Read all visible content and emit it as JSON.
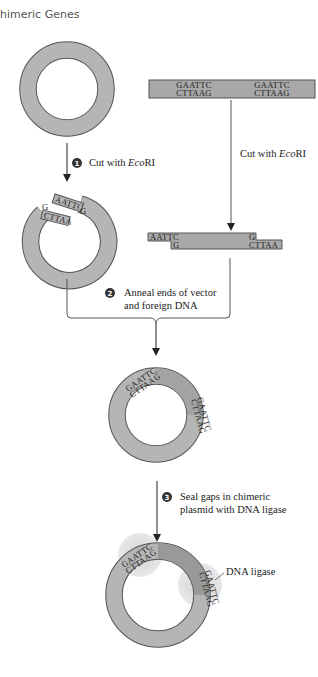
{
  "header": {
    "title": "himeric Genes"
  },
  "colors": {
    "dna_fill": "#b5b5b5",
    "dna_fill_dark": "#999999",
    "outline": "#555555",
    "ligase_spot": "#d6d6d6",
    "text": "#222222",
    "arrow": "#333333"
  },
  "foreign_dna": {
    "top_left": "GAATTC",
    "bottom_left": "CTTAAG",
    "top_right": "GAATTC",
    "bottom_right": "CTTAAG"
  },
  "cut_fragment": {
    "top_left": "AATTC",
    "bottom_left": "G",
    "top_right": "G",
    "bottom_right": "CTTAA"
  },
  "cut_plasmid": {
    "upper_end": "AATTC",
    "upper_end_g": "G",
    "lower_end": "CTTAA",
    "lower_end_g": "G"
  },
  "steps": [
    {
      "number": "1",
      "label_prefix": "Cut with ",
      "label_italic": "Eco",
      "label_suffix": "RI"
    },
    {
      "number": "2",
      "line1": "Anneal ends of vector",
      "line2": "and foreign DNA"
    },
    {
      "number": "3",
      "line1": "Seal gaps in chimeric",
      "line2": "plasmid with DNA ligase"
    }
  ],
  "foreign_cut_label": {
    "prefix": "Cut with ",
    "italic": "Eco",
    "suffix": "RI"
  },
  "ligase_label": "DNA ligase",
  "chimeric_sites": [
    "GAATTC",
    "CTTAAG"
  ]
}
